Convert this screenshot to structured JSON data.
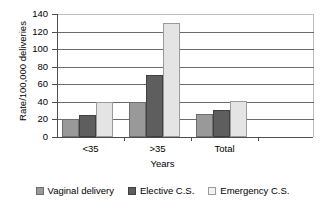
{
  "chart_data": {
    "type": "bar",
    "title": "",
    "xlabel": "Years",
    "ylabel": "Rate/100,000 deliveries",
    "categories": [
      "<35",
      ">35",
      "Total"
    ],
    "series": [
      {
        "name": "Vaginal delivery",
        "color": "#999999",
        "values": [
          20,
          40,
          26
        ]
      },
      {
        "name": "Elective C.S.",
        "color": "#5e5e5e",
        "values": [
          25,
          70,
          31
        ]
      },
      {
        "name": "Emergency C.S.",
        "color": "#e4e4e4",
        "values": [
          40,
          130,
          41
        ]
      }
    ],
    "ylim": [
      0,
      140
    ],
    "ytick_step": 20,
    "yticks": [
      0,
      20,
      40,
      60,
      80,
      100,
      120,
      140
    ],
    "grid": true,
    "legend_position": "bottom"
  }
}
